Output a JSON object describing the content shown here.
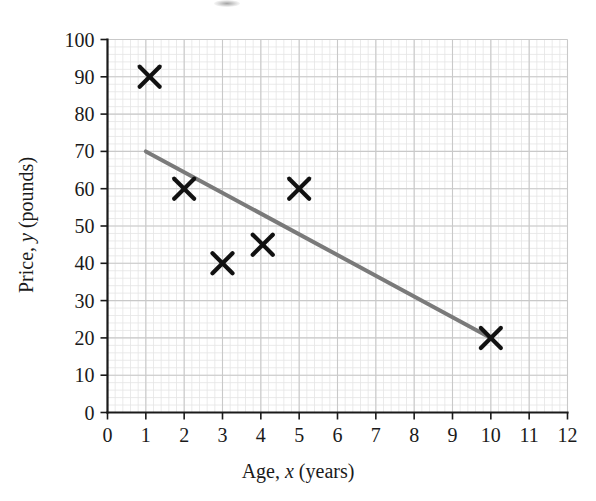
{
  "figure": {
    "background_color": "#ffffff",
    "axis_color": "#1a1a1a",
    "grid_major_color": "#c9c9c9",
    "grid_minor_color": "#e4e4e4",
    "marker_color": "#111111",
    "line_color": "#7a7a7a"
  },
  "chart_data": {
    "type": "scatter",
    "title": "",
    "subtitle": "",
    "xlabel": "Age, x (years)",
    "xlabel_parts": {
      "before": "Age,",
      "italic": "x",
      "after": "(years)"
    },
    "ylabel": "Price, y (pounds)",
    "ylabel_parts": {
      "before": "Price,",
      "italic": "y",
      "after": "(pounds)"
    },
    "xlim": [
      0,
      12
    ],
    "ylim": [
      0,
      100
    ],
    "xticks": [
      0,
      1,
      2,
      3,
      4,
      5,
      6,
      7,
      8,
      9,
      10,
      11,
      12
    ],
    "yticks": [
      0,
      10,
      20,
      30,
      40,
      50,
      60,
      70,
      80,
      90,
      100
    ],
    "xtick_labels": [
      "0",
      "1",
      "2",
      "3",
      "4",
      "5",
      "6",
      "7",
      "8",
      "9",
      "10",
      "11",
      "12"
    ],
    "ytick_labels": [
      "0",
      "10",
      "20",
      "30",
      "40",
      "50",
      "60",
      "70",
      "80",
      "90",
      "100"
    ],
    "grid": true,
    "grid_minor_step_x": 0.2,
    "grid_minor_step_y": 2,
    "legend": false,
    "legend_position": "none",
    "marker_symbol": "x-cross",
    "series": [
      {
        "name": "Car price vs age",
        "points": [
          {
            "x": 1.1,
            "y": 90
          },
          {
            "x": 2.0,
            "y": 60
          },
          {
            "x": 3.0,
            "y": 40
          },
          {
            "x": 4.05,
            "y": 45
          },
          {
            "x": 5.0,
            "y": 60
          },
          {
            "x": 10.0,
            "y": 20
          }
        ]
      }
    ],
    "trend_line": {
      "name": "line of best fit",
      "x_start": 1.0,
      "y_start": 70,
      "x_end": 10.0,
      "y_end": 20,
      "color": "#7a7a7a",
      "width": 4
    },
    "annotations": []
  }
}
